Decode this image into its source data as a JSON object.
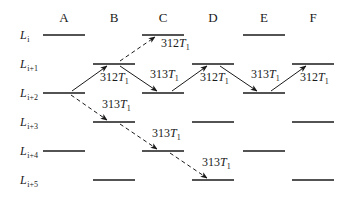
{
  "diagram": {
    "columns": [
      {
        "id": "A",
        "label": "A",
        "x1": 43,
        "x2": 85
      },
      {
        "id": "B",
        "label": "B",
        "x1": 93,
        "x2": 135
      },
      {
        "id": "C",
        "label": "C",
        "x1": 142,
        "x2": 184
      },
      {
        "id": "D",
        "label": "D",
        "x1": 192,
        "x2": 234
      },
      {
        "id": "E",
        "label": "E",
        "x1": 243,
        "x2": 285
      },
      {
        "id": "F",
        "label": "F",
        "x1": 292,
        "x2": 334
      }
    ],
    "rows": [
      {
        "id": "Li",
        "main": "L",
        "sub": "i",
        "y": 35
      },
      {
        "id": "Li+1",
        "main": "L",
        "sub": "i+1",
        "y": 64
      },
      {
        "id": "Li+2",
        "main": "L",
        "sub": "i+2",
        "y": 93
      },
      {
        "id": "Li+3",
        "main": "L",
        "sub": "i+3",
        "y": 122
      },
      {
        "id": "Li+4",
        "main": "L",
        "sub": "i+4",
        "y": 151
      },
      {
        "id": "Li+5",
        "main": "L",
        "sub": "i+5",
        "y": 180
      }
    ],
    "levels": [
      {
        "col": "A",
        "row": "Li"
      },
      {
        "col": "C",
        "row": "Li"
      },
      {
        "col": "E",
        "row": "Li"
      },
      {
        "col": "B",
        "row": "Li+1"
      },
      {
        "col": "D",
        "row": "Li+1"
      },
      {
        "col": "F",
        "row": "Li+1"
      },
      {
        "col": "A",
        "row": "Li+2"
      },
      {
        "col": "C",
        "row": "Li+2"
      },
      {
        "col": "E",
        "row": "Li+2"
      },
      {
        "col": "B",
        "row": "Li+3"
      },
      {
        "col": "D",
        "row": "Li+3"
      },
      {
        "col": "F",
        "row": "Li+3"
      },
      {
        "col": "A",
        "row": "Li+4"
      },
      {
        "col": "C",
        "row": "Li+4"
      },
      {
        "col": "E",
        "row": "Li+4"
      },
      {
        "col": "B",
        "row": "Li+5"
      },
      {
        "col": "D",
        "row": "Li+5"
      },
      {
        "col": "F",
        "row": "Li+5"
      }
    ],
    "transitions": [
      {
        "from": "A:Li+2",
        "to": "B:Li+1",
        "style": "solid",
        "label": "312T1",
        "x1": 72,
        "y1": 91,
        "x2": 107,
        "y2": 66,
        "lx": 100,
        "ly": 81
      },
      {
        "from": "B:Li+1",
        "to": "C:Li+2",
        "style": "solid",
        "label": "313T1",
        "x1": 120,
        "y1": 66,
        "x2": 157,
        "y2": 91,
        "lx": 150,
        "ly": 78
      },
      {
        "from": "C:Li+2",
        "to": "D:Li+1",
        "style": "solid",
        "label": "312T1",
        "x1": 172,
        "y1": 91,
        "x2": 207,
        "y2": 66,
        "lx": 200,
        "ly": 81
      },
      {
        "from": "D:Li+1",
        "to": "E:Li+2",
        "style": "solid",
        "label": "313T1",
        "x1": 220,
        "y1": 66,
        "x2": 257,
        "y2": 91,
        "lx": 251,
        "ly": 78
      },
      {
        "from": "E:Li+2",
        "to": "F:Li+1",
        "style": "solid",
        "label": "312T1",
        "x1": 271,
        "y1": 91,
        "x2": 306,
        "y2": 66,
        "lx": 300,
        "ly": 81
      },
      {
        "from": "B:Li+1",
        "to": "C:Li",
        "style": "dashed",
        "label": "312T1",
        "x1": 120,
        "y1": 61,
        "x2": 155,
        "y2": 37,
        "lx": 161,
        "ly": 47
      },
      {
        "from": "A:Li+2",
        "to": "B:Li+3",
        "style": "dashed",
        "label": "313T1",
        "x1": 71,
        "y1": 95,
        "x2": 107,
        "y2": 120,
        "lx": 102,
        "ly": 108
      },
      {
        "from": "B:Li+3",
        "to": "C:Li+4",
        "style": "dashed",
        "label": "313T1",
        "x1": 120,
        "y1": 124,
        "x2": 157,
        "y2": 149,
        "lx": 152,
        "ly": 137
      },
      {
        "from": "C:Li+4",
        "to": "D:Li+5",
        "style": "dashed",
        "label": "313T1",
        "x1": 170,
        "y1": 153,
        "x2": 207,
        "y2": 178,
        "lx": 202,
        "ly": 166
      }
    ]
  },
  "colors": {
    "ink": "#1a1a1a",
    "background": "#ffffff"
  }
}
